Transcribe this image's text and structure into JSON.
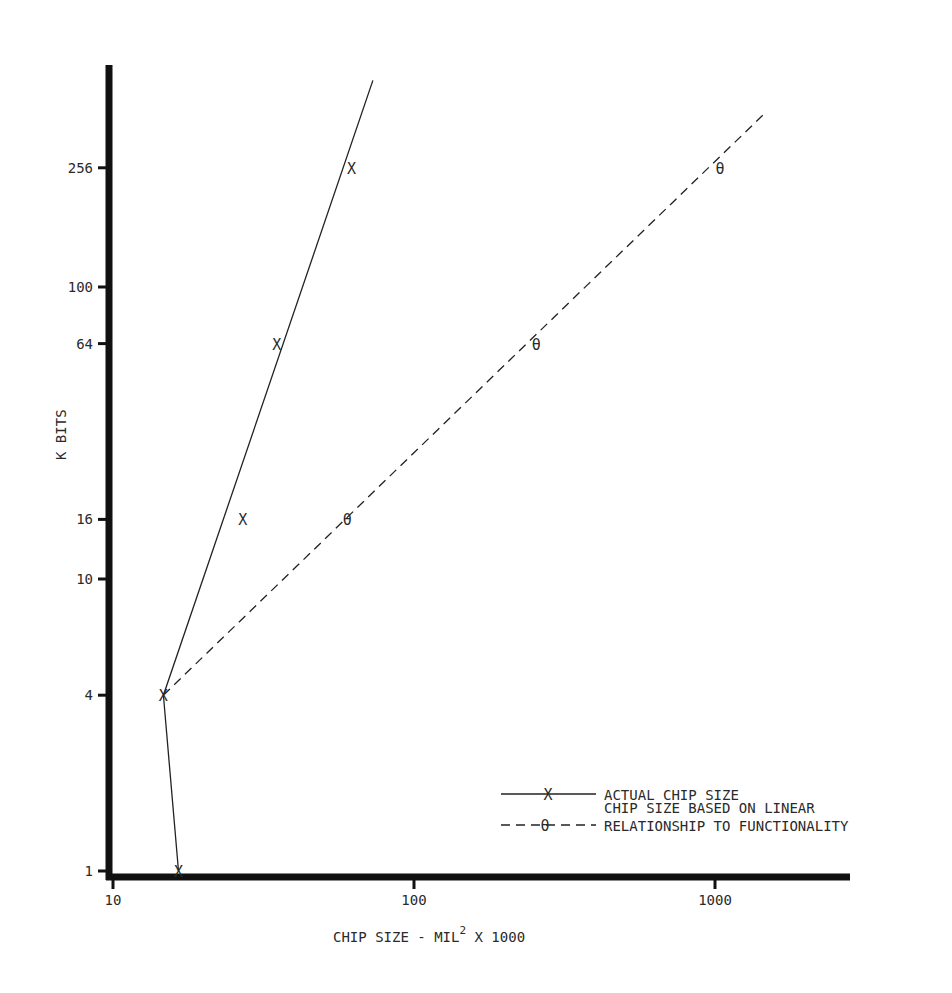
{
  "chart_data": {
    "type": "line",
    "title": "",
    "xlabel": "CHIP SIZE - MIL",
    "xlabel_superscript": "2",
    "xlabel_suffix": " X 1000",
    "ylabel": "K BITS",
    "xscale": "log",
    "yscale": "log",
    "xlim": [
      10,
      2200
    ],
    "ylim": [
      1,
      700
    ],
    "grid": false,
    "legend_position": "lower right",
    "x_ticks": [
      {
        "value": 10,
        "label": "10"
      },
      {
        "value": 100,
        "label": "100"
      },
      {
        "value": 1000,
        "label": "1000"
      }
    ],
    "y_ticks": [
      {
        "value": 1,
        "label": "1"
      },
      {
        "value": 4,
        "label": "4"
      },
      {
        "value": 10,
        "label": "10"
      },
      {
        "value": 16,
        "label": "16"
      },
      {
        "value": 64,
        "label": "64"
      },
      {
        "value": 100,
        "label": "100"
      },
      {
        "value": 256,
        "label": "256"
      }
    ],
    "series": [
      {
        "name": "ACTUAL CHIP SIZE",
        "style": "solid",
        "marker": "X",
        "points": [
          {
            "x": 16.5,
            "y": 1
          },
          {
            "x": 14.7,
            "y": 4
          },
          {
            "x": 27,
            "y": 16
          },
          {
            "x": 35,
            "y": 64
          },
          {
            "x": 62,
            "y": 256
          }
        ],
        "line_path": [
          {
            "x": 16.5,
            "y": 1
          },
          {
            "x": 14.7,
            "y": 4
          },
          {
            "x": 73,
            "y": 510
          }
        ]
      },
      {
        "name": "CHIP SIZE BASED ON LINEAR RELATIONSHIP TO FUNCTIONALITY",
        "style": "dashed",
        "marker": "θ",
        "points": [
          {
            "x": 14.7,
            "y": 4
          },
          {
            "x": 60,
            "y": 16
          },
          {
            "x": 255,
            "y": 64
          },
          {
            "x": 1040,
            "y": 256
          }
        ],
        "line_path": [
          {
            "x": 14.7,
            "y": 4
          },
          {
            "x": 1450,
            "y": 390
          }
        ]
      }
    ]
  },
  "legend": {
    "actual": {
      "marker": "X",
      "label": "ACTUAL CHIP SIZE"
    },
    "linear": {
      "marker": "θ",
      "label_line1": "CHIP SIZE BASED ON LINEAR",
      "label_line2": "RELATIONSHIP TO FUNCTIONALITY"
    }
  },
  "axes": {
    "y_title": "K BITS",
    "x_title_main": "CHIP SIZE - MIL",
    "x_title_sup": "2",
    "x_title_tail": " X 1000"
  },
  "colors": {
    "ink": "#1a1a1a",
    "text": "#2a2a2a",
    "background": "#ffffff"
  }
}
